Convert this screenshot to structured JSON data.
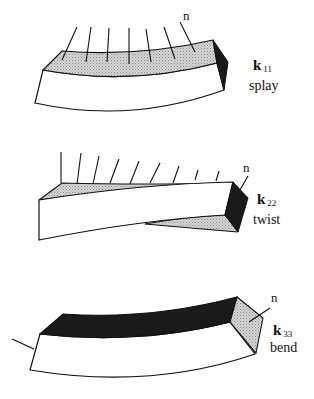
{
  "figure": {
    "panels": [
      {
        "id": "splay",
        "constant_symbol": "k",
        "constant_subscript": "11",
        "mode_label": "splay",
        "director_label": "n"
      },
      {
        "id": "twist",
        "constant_symbol": "k",
        "constant_subscript": "22",
        "mode_label": "twist",
        "director_label": "n"
      },
      {
        "id": "bend",
        "constant_symbol": "k",
        "constant_subscript": "33",
        "mode_label": "bend",
        "director_label": "n"
      }
    ]
  },
  "colors": {
    "stroke": "#111111",
    "shaded_face": "#c8c8c8",
    "dark_face": "#1a1a1a",
    "background": "#ffffff"
  }
}
